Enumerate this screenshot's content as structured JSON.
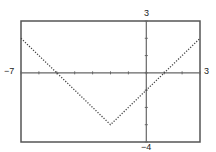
{
  "chart_data": {
    "type": "line",
    "title": "",
    "function": "y = |x + 2| - 3",
    "xlabel": "",
    "ylabel": "",
    "xlim": [
      -7,
      3
    ],
    "ylim": [
      -4,
      3
    ],
    "xscale": 1,
    "yscale": 1,
    "grid": false,
    "line_style": "dotted",
    "series": [
      {
        "name": "f(x)",
        "x": [
          -7,
          -6,
          -5,
          -4,
          -3,
          -2,
          -1,
          0,
          1,
          2,
          3
        ],
        "values": [
          2,
          1,
          0,
          -1,
          -2,
          -3,
          -2,
          -1,
          0,
          1,
          2
        ]
      }
    ],
    "vertex": [
      -2,
      -3
    ],
    "x_intercepts": [
      -5,
      1
    ],
    "y_intercept": -1
  },
  "labels": {
    "xmin": "−7",
    "xmax": "3",
    "ymax": "3",
    "ymin": "−4"
  },
  "colors": {
    "frame": "#555555",
    "axis": "#666666",
    "curve": "#444444"
  }
}
